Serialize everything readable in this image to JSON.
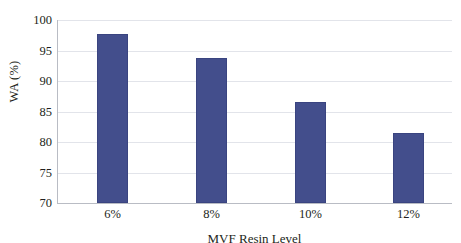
{
  "chart_data": {
    "type": "bar",
    "title": "",
    "subtitle": "",
    "categories": [
      "6%",
      "8%",
      "10%",
      "12%"
    ],
    "values": [
      97.7,
      93.8,
      86.6,
      81.5
    ],
    "series": [
      {
        "name": "WA",
        "values": [
          97.7,
          93.8,
          86.6,
          81.5
        ]
      }
    ],
    "xlabel": "MVF Resin Level",
    "ylabel": "WA (%)",
    "ylim": [
      70,
      100
    ],
    "yticks": [
      70,
      75,
      80,
      85,
      90,
      95,
      100
    ],
    "ytick_labels": [
      "70",
      "75",
      "80",
      "85",
      "90",
      "95",
      "100"
    ],
    "xtick_labels": [
      "6%",
      "8%",
      "10%",
      "12%"
    ],
    "grid": true,
    "grid_axis": "y",
    "legend": false,
    "legend_position": "none",
    "bar_color": "#434E8C",
    "grid_color": "#E2E4EA",
    "axis_color": "#B9BCC4",
    "background": "#FFFFFF",
    "text_color": "#231F20",
    "annotations": []
  }
}
